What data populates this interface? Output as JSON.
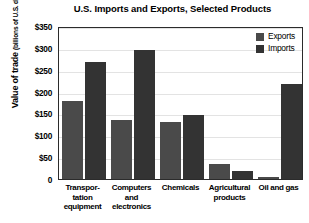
{
  "chart_data": {
    "type": "bar",
    "title": "U.S. Imports and Exports, Selected Products",
    "xlabel": "",
    "ylabel": "Value of trade",
    "ylabel_units": "(billions of U.S. dollars)",
    "ylim": [
      0,
      350
    ],
    "ytick_labels": [
      "$350",
      "$300",
      "$250",
      "$200",
      "$150",
      "$100",
      "$50",
      "0"
    ],
    "ytick_values": [
      350,
      300,
      250,
      200,
      150,
      100,
      50,
      0
    ],
    "grid": true,
    "legend_position": "top-right",
    "categories": [
      "Transpor-\ntation\nequipment",
      "Computers\nand\nelectronics",
      "Chemicals",
      "Agricultural\nproducts",
      "Oil and gas"
    ],
    "series": [
      {
        "name": "Exports",
        "color": "#4a4a4a",
        "values": [
          178,
          135,
          130,
          35,
          5
        ]
      },
      {
        "name": "Imports",
        "color": "#333333",
        "values": [
          268,
          295,
          147,
          18,
          217
        ]
      }
    ]
  }
}
